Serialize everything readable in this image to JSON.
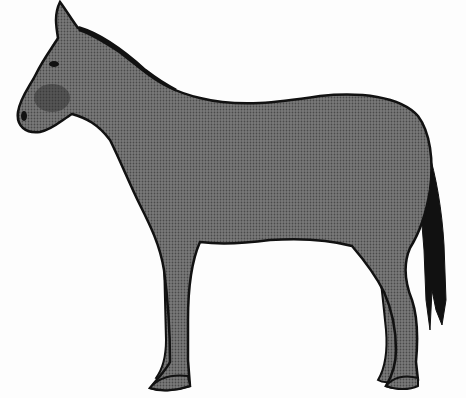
{
  "image": {
    "subject": "donkey illustration",
    "description": "Side profile of a standing donkey/mule facing left, halftone gray body with black outline and dark tail",
    "colors": {
      "background": "#fdfdfd",
      "body": "#6f6f6f",
      "outline": "#111111",
      "tail": "#111111",
      "shading": "#2a2a2a"
    }
  }
}
